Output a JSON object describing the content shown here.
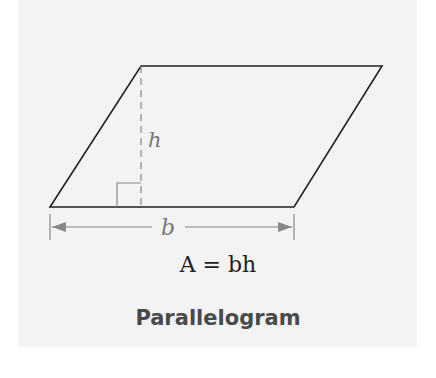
{
  "figure": {
    "title": "Parallelogram",
    "formula": "A = bh",
    "labels": {
      "height": "h",
      "base": "b"
    },
    "colors": {
      "background": "#f3f3f3",
      "outline": "#222222",
      "guide": "#888888",
      "title": "#4a4a4a"
    }
  }
}
